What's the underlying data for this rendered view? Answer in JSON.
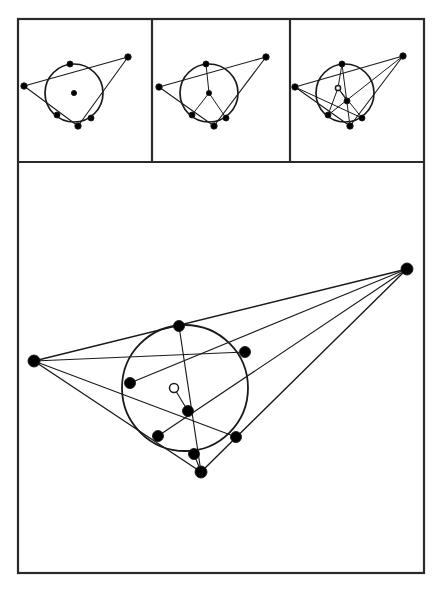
{
  "figure": {
    "background_color": "#ffffff",
    "stroke_color": "#1a1a1a",
    "frame_color": "#2a2a2a",
    "point_fill": "#000000",
    "point_hollow_fill": "#ffffff",
    "frame": {
      "x": 18,
      "y": 19,
      "width": 406,
      "height": 554,
      "stroke_width": 2.2
    },
    "dividers": {
      "vertical_x": [
        152,
        290
      ],
      "horizontal_y": 162,
      "panel_top_y": 19,
      "panel_bottom_y": 162
    }
  },
  "panels": [
    {
      "name": "panel-1-incircle",
      "label": "Step 1: incircle and center",
      "box": {
        "x": 18,
        "y": 19,
        "width": 134,
        "height": 143
      },
      "triangle": [
        [
          24,
          86
        ],
        [
          72,
          65
        ],
        [
          128,
          57
        ]
      ],
      "vertices": [
        [
          24,
          86
        ],
        [
          128,
          57
        ],
        [
          78,
          126
        ]
      ],
      "incircle": {
        "cx": 74,
        "cy": 93,
        "r": 29
      },
      "center_point": [
        74,
        93
      ],
      "center_point_style": "filled",
      "tangent_points": [
        [
          70,
          64
        ],
        [
          91,
          118
        ],
        [
          57,
          115
        ]
      ],
      "show_radii": false,
      "show_cevians": false
    },
    {
      "name": "panel-2-radii",
      "label": "Step 2: radii to tangent points",
      "box": {
        "x": 152,
        "y": 19,
        "width": 138,
        "height": 143
      },
      "vertices": [
        [
          159,
          87
        ],
        [
          266,
          57
        ],
        [
          214,
          126
        ]
      ],
      "incircle": {
        "cx": 209,
        "cy": 93,
        "r": 29
      },
      "center_point": [
        209,
        93
      ],
      "center_point_style": "filled",
      "tangent_points": [
        [
          206,
          64
        ],
        [
          226,
          118
        ],
        [
          192,
          115
        ]
      ],
      "show_radii": true,
      "show_cevians": false
    },
    {
      "name": "panel-3-cevians",
      "label": "Step 3: cevians meet at Gergonne point",
      "box": {
        "x": 290,
        "y": 19,
        "width": 134,
        "height": 143
      },
      "vertices": [
        [
          295,
          87
        ],
        [
          403,
          56
        ],
        [
          350,
          126
        ]
      ],
      "incircle": {
        "cx": 345,
        "cy": 93,
        "r": 29
      },
      "center_point": [
        338,
        88
      ],
      "center_point_style": "hollow",
      "gergonne_point": [
        347,
        101
      ],
      "tangent_points": [
        [
          342,
          64
        ],
        [
          362,
          118
        ],
        [
          328,
          115
        ]
      ],
      "show_radii": true,
      "show_cevians": true
    }
  ],
  "main_panel": {
    "name": "main-gergonne-diagram",
    "label": "Full Gergonne point construction",
    "box": {
      "x": 18,
      "y": 162,
      "width": 406,
      "height": 411
    },
    "vertices": {
      "A": [
        34,
        361
      ],
      "B": [
        407,
        269
      ],
      "C": [
        201,
        472
      ]
    },
    "vertex_labels": [
      "A",
      "B",
      "C"
    ],
    "incircle": {
      "cx": 185,
      "cy": 388,
      "r": 63
    },
    "incenter": [
      174,
      388
    ],
    "incenter_style": "hollow",
    "gergonne_point": [
      188,
      411
    ],
    "gergonne_point_style": "filled",
    "tangent_points": {
      "on_AB": [
        179,
        326
      ],
      "on_BC": [
        236,
        437
      ],
      "on_CA": [
        158,
        436
      ]
    },
    "extra_circle_points": [
      [
        245,
        352
      ],
      [
        130,
        383
      ],
      [
        194,
        454
      ]
    ],
    "points": [
      {
        "id": "A",
        "xy": [
          34,
          361
        ],
        "style": "filled",
        "r": 6.0
      },
      {
        "id": "B",
        "xy": [
          407,
          269
        ],
        "style": "filled",
        "r": 6.0
      },
      {
        "id": "C",
        "xy": [
          201,
          472
        ],
        "style": "filled",
        "r": 6.0
      },
      {
        "id": "T_AB",
        "xy": [
          179,
          326
        ],
        "style": "filled",
        "r": 5.5
      },
      {
        "id": "P_BE",
        "xy": [
          245,
          352
        ],
        "style": "filled",
        "r": 5.5
      },
      {
        "id": "P_AD",
        "xy": [
          130,
          383
        ],
        "style": "filled",
        "r": 5.5
      },
      {
        "id": "T_CA",
        "xy": [
          158,
          436
        ],
        "style": "filled",
        "r": 5.5
      },
      {
        "id": "T_BC",
        "xy": [
          236,
          437
        ],
        "style": "filled",
        "r": 5.5
      },
      {
        "id": "P_low",
        "xy": [
          194,
          454
        ],
        "style": "filled",
        "r": 5.5
      },
      {
        "id": "Ge",
        "xy": [
          188,
          411
        ],
        "style": "filled",
        "r": 5.5
      },
      {
        "id": "I",
        "xy": [
          174,
          388
        ],
        "style": "hollow",
        "r": 4.5
      }
    ],
    "segments": [
      {
        "from": "A",
        "to": "B",
        "kind": "triangle-side"
      },
      {
        "from": "B",
        "to": "C",
        "kind": "triangle-side"
      },
      {
        "from": "C",
        "to": "A",
        "kind": "triangle-side"
      },
      {
        "from": "A",
        "to": "T_BC",
        "kind": "cevian"
      },
      {
        "from": "B",
        "to": "T_CA",
        "kind": "cevian"
      },
      {
        "from": "C",
        "to": "T_AB",
        "kind": "cevian"
      },
      {
        "from": "A",
        "to": "P_BE",
        "kind": "chord-line"
      },
      {
        "from": "B",
        "to": "P_AD",
        "kind": "chord-line"
      },
      {
        "from": "C",
        "to": "P_low",
        "kind": "chord-line"
      },
      {
        "from": "I",
        "to": "Ge",
        "kind": "center-link"
      }
    ]
  }
}
